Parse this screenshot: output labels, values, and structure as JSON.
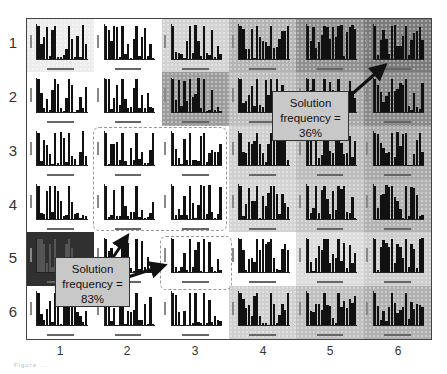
{
  "figure": {
    "row_labels": [
      "1",
      "2",
      "3",
      "4",
      "5",
      "6"
    ],
    "col_labels": [
      "1",
      "2",
      "3",
      "4",
      "5",
      "6"
    ],
    "callouts": [
      {
        "id": "callout-36",
        "line1": "Solution",
        "line2": "frequency =",
        "line3": "36%"
      },
      {
        "id": "callout-83",
        "line1": "Solution",
        "line2": "frequency =",
        "line3": "83%"
      }
    ],
    "cell_backgrounds": [
      [
        "#ececec",
        "#ffffff",
        "#d2d2d2",
        "#b4b4b4",
        "#8f8f8f",
        "#7a7a7a"
      ],
      [
        "#ffffff",
        "#ffffff",
        "#9c9c9c",
        "#bdbdbd",
        "#a8a8a8",
        "#8a8a8a"
      ],
      [
        "#ffffff",
        "#ffffff",
        "#ffffff",
        "#cfcfcf",
        "#bcbcbc",
        "#a9a9a9"
      ],
      [
        "#ffffff",
        "#ffffff",
        "#ffffff",
        "#d4d4d4",
        "#c6c6c6",
        "#b2b2b2"
      ],
      [
        "#303030",
        "#ffffff",
        "#ffffff",
        "#ffffff",
        "#dcdcdc",
        "#cdcdcd"
      ],
      [
        "#ffffff",
        "#ffffff",
        "#ffffff",
        "#d0d0d0",
        "#bfbfbf",
        "#b0b0b0"
      ]
    ]
  },
  "chart_data": {
    "type": "heatmap",
    "title": "",
    "xlabel": "",
    "ylabel": "",
    "rows": [
      "1",
      "2",
      "3",
      "4",
      "5",
      "6"
    ],
    "columns": [
      "1",
      "2",
      "3",
      "4",
      "5",
      "6"
    ],
    "annotations": [
      {
        "text": "Solution frequency = 36%",
        "points_to": {
          "row": 1,
          "col": 6
        }
      },
      {
        "text": "Solution frequency = 83%",
        "points_to": [
          {
            "row": 4,
            "col": 2
          },
          {
            "row": 5,
            "col": 3
          }
        ]
      }
    ]
  },
  "caption": "Figure ..."
}
